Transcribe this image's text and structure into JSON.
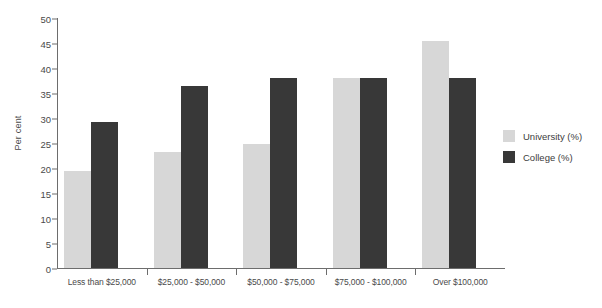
{
  "chart_data": {
    "type": "bar",
    "title": "",
    "xlabel": "",
    "ylabel": "Per cent",
    "ylim": [
      0,
      50
    ],
    "yticks": [
      0,
      5,
      10,
      15,
      20,
      25,
      30,
      35,
      40,
      45,
      50
    ],
    "grid": false,
    "legend_position": "right",
    "categories": [
      "Less than $25,000",
      "$25,000 - $50,000",
      "$50,000 - $75,000",
      "$75,000 - $100,000",
      "Over $100,000"
    ],
    "series": [
      {
        "name": "University (%)",
        "color": "#d7d7d7",
        "values": [
          19.5,
          23.2,
          24.9,
          38.0,
          45.4
        ]
      },
      {
        "name": "College (%)",
        "color": "#383838",
        "values": [
          29.3,
          36.5,
          38.0,
          38.0,
          38.0
        ]
      }
    ]
  },
  "colors": {
    "university": "#d7d7d7",
    "college": "#383838",
    "axis": "#6d6d6d",
    "text": "#4a4a4a",
    "background": "#ffffff"
  }
}
